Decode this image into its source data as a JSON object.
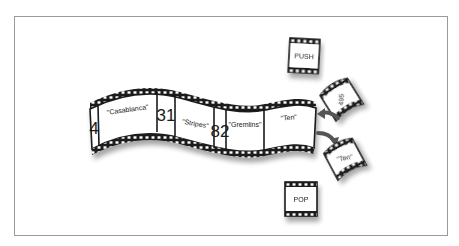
{
  "diagram": {
    "strip": {
      "frames": [
        {
          "label": "4",
          "kind": "number"
        },
        {
          "label": "\"Casablanca\"",
          "kind": "string"
        },
        {
          "label": "31",
          "kind": "number"
        },
        {
          "label": "\"Stripes\"",
          "kind": "string"
        },
        {
          "label": "82",
          "kind": "number"
        },
        {
          "label": "\"Gremlins\"",
          "kind": "string"
        },
        {
          "label": "\"Ten\"",
          "kind": "string"
        }
      ]
    },
    "push_card": {
      "label": "PUSH"
    },
    "incoming_card": {
      "label": "495"
    },
    "outgoing_card": {
      "label": "\"Ten\""
    },
    "pop_card": {
      "label": "POP"
    },
    "arrows": [
      {
        "name": "push-arrow",
        "direction": "into-strip"
      },
      {
        "name": "pop-arrow",
        "direction": "out-of-strip"
      }
    ],
    "colors": {
      "ink": "#1a1a1a",
      "border": "#9a9a9a",
      "paper": "#ffffff",
      "arrow": "#555555"
    }
  }
}
